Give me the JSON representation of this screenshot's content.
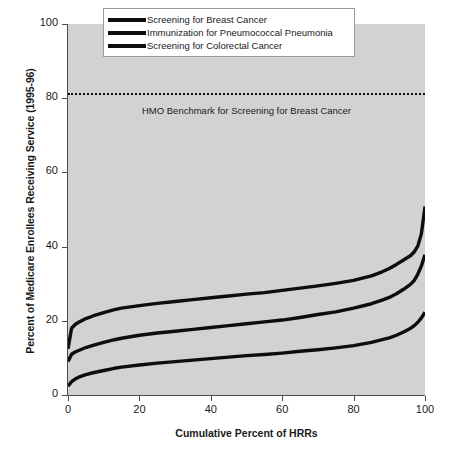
{
  "chart_data": {
    "type": "line",
    "title": "",
    "xlabel": "Cumulative Percent of HRRs",
    "ylabel": "Percent of Medicare Enrollees Receiving Service (1995-96)",
    "xlim": [
      0,
      100
    ],
    "ylim": [
      0,
      100
    ],
    "xticks": [
      "0",
      "20",
      "40",
      "60",
      "80",
      "100"
    ],
    "yticks": [
      "0",
      "20",
      "40",
      "60",
      "80",
      "100"
    ],
    "grid": false,
    "legend_position": "top-center",
    "x": [
      0,
      1,
      2,
      3,
      5,
      7,
      10,
      13,
      15,
      20,
      25,
      30,
      35,
      40,
      45,
      50,
      55,
      60,
      65,
      70,
      75,
      80,
      85,
      88,
      90,
      92,
      94,
      96,
      97,
      98,
      99,
      100
    ],
    "series": [
      {
        "name": "Screening for Breast Cancer",
        "color": "#0d0d0d",
        "values": [
          12.5,
          18.0,
          19.0,
          19.6,
          20.6,
          21.3,
          22.2,
          23.0,
          23.4,
          24.1,
          24.7,
          25.2,
          25.7,
          26.2,
          26.7,
          27.2,
          27.6,
          28.2,
          28.8,
          29.4,
          30.1,
          30.9,
          32.1,
          33.2,
          34.1,
          35.2,
          36.4,
          37.6,
          38.6,
          40.2,
          43.5,
          50.8
        ]
      },
      {
        "name": "Immunization for Pneumococcal Pneumonia",
        "color": "#0d0d0d",
        "values": [
          9.0,
          11.0,
          11.6,
          12.0,
          12.8,
          13.4,
          14.2,
          14.9,
          15.3,
          16.1,
          16.7,
          17.2,
          17.7,
          18.2,
          18.7,
          19.2,
          19.7,
          20.2,
          20.9,
          21.7,
          22.4,
          23.4,
          24.6,
          25.6,
          26.3,
          27.3,
          28.5,
          29.9,
          30.9,
          32.6,
          34.8,
          37.8
        ]
      },
      {
        "name": "Screening for Colorectal Cancer",
        "color": "#0d0d0d",
        "values": [
          2.4,
          3.6,
          4.3,
          4.8,
          5.5,
          6.0,
          6.6,
          7.2,
          7.5,
          8.1,
          8.6,
          9.0,
          9.4,
          9.8,
          10.2,
          10.6,
          10.9,
          11.3,
          11.8,
          12.2,
          12.7,
          13.3,
          14.2,
          14.9,
          15.4,
          16.1,
          17.0,
          18.0,
          18.7,
          19.6,
          20.8,
          22.3
        ]
      }
    ],
    "annotations": [
      {
        "name": "hmo-benchmark",
        "label": "HMO Benchmark for Screening for Breast Cancer",
        "value": 81.5,
        "style": "dotted-horizontal-line"
      }
    ]
  },
  "legend": {
    "items": [
      {
        "label": "Screening for Breast Cancer"
      },
      {
        "label": "Immunization for Pneumococcal Pneumonia"
      },
      {
        "label": "Screening for Colorectal Cancer"
      }
    ]
  }
}
